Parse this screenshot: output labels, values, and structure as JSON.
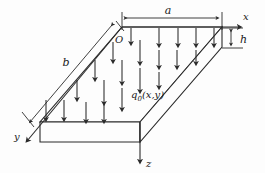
{
  "figure": {
    "background_color": "#fdfdfd",
    "line_color": "#2a2a2a",
    "plate_face_color": "#fcfcfc"
  },
  "labels": {
    "dim_a": "a",
    "dim_b": "b",
    "dim_h": "h",
    "axis_x": "x",
    "axis_y": "y",
    "axis_z": "z",
    "origin": "O",
    "load_symbol": "q",
    "load_subscript": "0",
    "load_args": "(x,y)",
    "load_full": "q0(x,y)"
  },
  "geometry": {
    "top_face_corners": [
      [
        122,
        27
      ],
      [
        222,
        27
      ],
      [
        140,
        122
      ],
      [
        40,
        122
      ]
    ],
    "thickness_px": 20,
    "axis_x_end": [
      243,
      27
    ],
    "axis_y_end": [
      24,
      144
    ],
    "axis_z_end": [
      140,
      166
    ],
    "dim_a_line_y": 18,
    "dim_a_x_start": 122,
    "dim_a_x_end": 222,
    "dim_h_x": 231,
    "dim_h_y_top": 29,
    "dim_h_y_bottom": 47
  },
  "load_arrows": {
    "count": 21,
    "description": "grid of downward load arrows over the plate top surface",
    "rows": [
      {
        "y_top": 27,
        "y_bottom": 45,
        "xs": [
          131,
          159,
          177,
          195,
          213
        ]
      },
      {
        "y_top": 40,
        "y_bottom": 62,
        "xs": [
          113,
          131,
          149,
          167,
          185
        ]
      },
      {
        "y_top": 58,
        "y_bottom": 82,
        "xs": [
          95,
          113,
          131,
          149
        ]
      },
      {
        "y_top": 78,
        "y_bottom": 104,
        "xs": [
          77,
          95,
          113,
          131
        ]
      },
      {
        "y_top": 100,
        "y_bottom": 124,
        "xs": [
          46,
          64,
          82,
          100
        ]
      }
    ]
  }
}
